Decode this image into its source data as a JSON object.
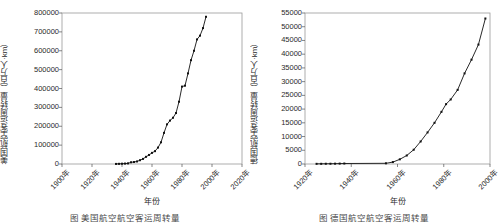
{
  "figure": {
    "panels": [
      "left",
      "right"
    ]
  },
  "left": {
    "caption": "图        美国航空航空客运周转量",
    "xlabel": "年份",
    "ylabel": "美国航空客运周转量（百万人·km）",
    "yticks": [
      "0",
      "100000",
      "200000",
      "300000",
      "400000",
      "500000",
      "600000",
      "700000",
      "800000"
    ],
    "xticks": [
      "1900年",
      "1920年",
      "1940年",
      "1960年",
      "1980年",
      "2000年",
      "2020年"
    ]
  },
  "right": {
    "caption": "图        德国航空航空客运周转量",
    "xlabel": "年份",
    "ylabel": "德国航空客运周转量（百万人·km）",
    "yticks": [
      "0",
      "5000",
      "10000",
      "15000",
      "20000",
      "25000",
      "30000",
      "35000",
      "40000",
      "45000",
      "50000",
      "55000"
    ],
    "xticks": [
      "1920年",
      "1940年",
      "1960年",
      "1980年",
      "2000年"
    ]
  },
  "chart_data": [
    {
      "type": "line",
      "id": "left",
      "title": "美国航空客运周转量",
      "xlabel": "年份",
      "ylabel": "美国航空客运周转量（百万人·km）",
      "xlim": [
        1900,
        2020
      ],
      "ylim": [
        0,
        800000
      ],
      "xtick_values": [
        1900,
        1920,
        1940,
        1960,
        1980,
        2000,
        2020
      ],
      "ytick_values": [
        0,
        100000,
        200000,
        300000,
        400000,
        500000,
        600000,
        700000,
        800000
      ],
      "grid": false,
      "legend": null,
      "marker": "square",
      "x": [
        1936,
        1938,
        1940,
        1942,
        1944,
        1946,
        1948,
        1950,
        1952,
        1954,
        1956,
        1958,
        1960,
        1962,
        1964,
        1966,
        1968,
        1970,
        1972,
        1974,
        1976,
        1978,
        1980,
        1982,
        1984,
        1986,
        1988,
        1990,
        1992,
        1994,
        1996
      ],
      "y": [
        400,
        900,
        1600,
        2300,
        3300,
        9000,
        10500,
        13500,
        20000,
        27000,
        38000,
        48000,
        59000,
        68000,
        87000,
        115000,
        165000,
        210000,
        230000,
        245000,
        270000,
        330000,
        410000,
        415000,
        480000,
        550000,
        600000,
        660000,
        680000,
        720000,
        780000
      ]
    },
    {
      "type": "line",
      "id": "right",
      "title": "德国航空客运周转量",
      "xlabel": "年份",
      "ylabel": "德国航空客运周转量（百万人·km）",
      "xlim": [
        1920,
        2000
      ],
      "ylim": [
        0,
        55000
      ],
      "xtick_values": [
        1920,
        1940,
        1960,
        1980,
        2000
      ],
      "ytick_values": [
        0,
        5000,
        10000,
        15000,
        20000,
        25000,
        30000,
        35000,
        40000,
        45000,
        50000,
        55000
      ],
      "grid": false,
      "legend": null,
      "marker": "square",
      "x": [
        1925,
        1927,
        1929,
        1931,
        1933,
        1935,
        1937,
        1955,
        1958,
        1961,
        1964,
        1967,
        1970,
        1973,
        1976,
        1979,
        1981,
        1983,
        1986,
        1989,
        1992,
        1995,
        1998
      ],
      "y": [
        60,
        70,
        90,
        100,
        120,
        150,
        180,
        250,
        700,
        1700,
        3100,
        5200,
        8200,
        11500,
        15000,
        19000,
        21800,
        23500,
        27000,
        33000,
        38000,
        43500,
        53000
      ]
    }
  ]
}
